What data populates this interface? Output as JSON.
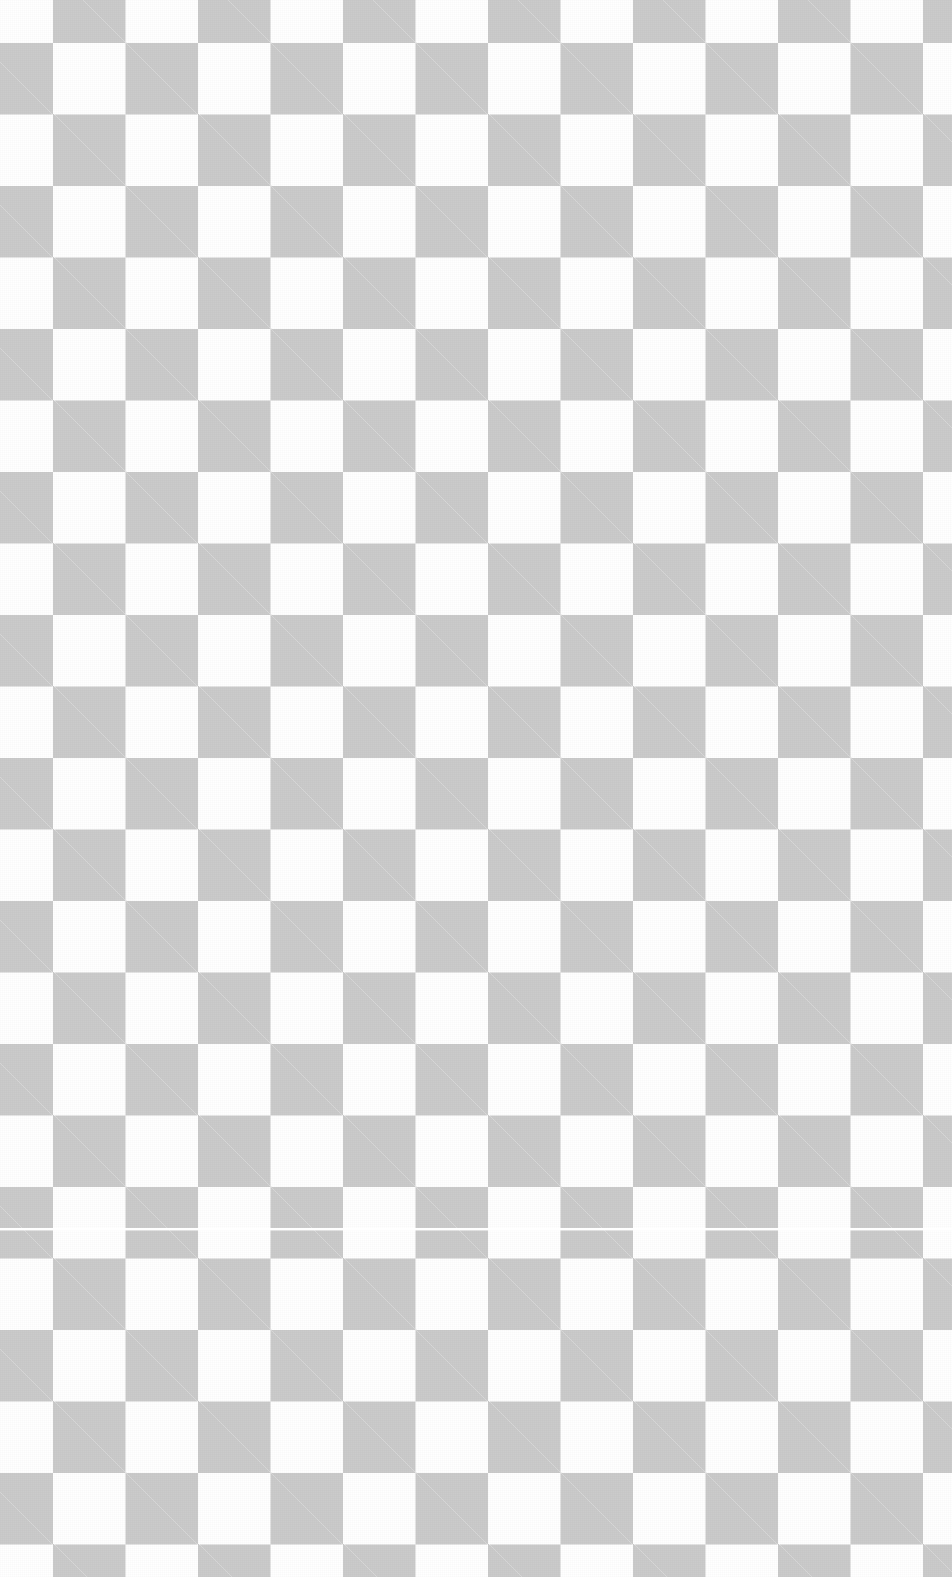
{
  "canvas": {
    "width_px": 952,
    "height_px": 1577,
    "content_description": "transparency checkerboard pattern (empty / fully transparent image area)",
    "has_text": false,
    "has_controls": false
  },
  "pattern": {
    "name": "alpha-transparency-checkerboard",
    "cell_width_px": 72.5,
    "cell_height_px": 71.5,
    "light_color": "#ffffff",
    "dark_color": "#cbcbcb",
    "origin_cell_color": "#ffffff",
    "x_phase_offset_px": 53,
    "y_phase_offset_px": 43,
    "columns_visible": 13,
    "rows_visible": 22,
    "texture": "fine pixel-level dither noise within the gray squares",
    "edge_rendering": "slightly antialiased / soft square borders"
  },
  "artifacts": {
    "seam": {
      "name": "horizontal-seam-line",
      "orientation": "horizontal",
      "y_px": 1228,
      "thickness_px": 2,
      "color": "#ffffff",
      "spans_full_width": true
    }
  }
}
